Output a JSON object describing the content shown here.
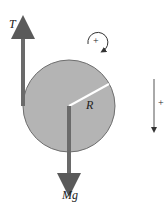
{
  "diagram": {
    "tension_label": "T",
    "radius_label": "R",
    "weight_label": "Mg",
    "rotation_sign": "+",
    "direction_sign": "+",
    "colors": {
      "disk_fill": "#b4b4b4",
      "disk_stroke": "#6e6e6e",
      "arrow": "#6a6a6a",
      "text": "#222222"
    }
  }
}
